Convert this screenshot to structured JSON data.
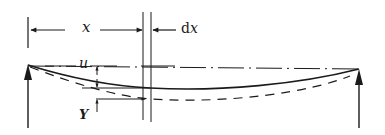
{
  "diagram": {
    "type": "beam-deflection",
    "labels": {
      "x": "x",
      "dx_prefix": "d",
      "dx_var": "x",
      "u": "u",
      "Y": "Y"
    },
    "colors": {
      "ink": "#1a1a1a",
      "background": "#ffffff"
    },
    "elements": [
      {
        "name": "left-support-arrow",
        "description": "upward reaction arrow at left support"
      },
      {
        "name": "right-support-arrow",
        "description": "upward reaction arrow at right support"
      },
      {
        "name": "chord-line",
        "style": "dash-dot",
        "description": "straight reference line between supports"
      },
      {
        "name": "deflection-curve",
        "style": "solid",
        "description": "deflected beam shape u"
      },
      {
        "name": "total-curve",
        "style": "dashed",
        "description": "total deflection Y"
      },
      {
        "name": "dimension-x",
        "description": "distance x from left support"
      },
      {
        "name": "dimension-dx",
        "description": "element width dx"
      }
    ]
  }
}
